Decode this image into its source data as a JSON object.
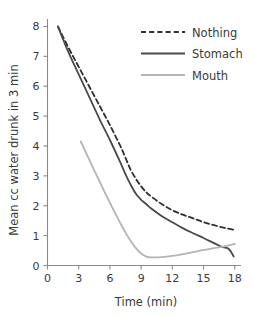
{
  "chart_data": {
    "type": "line",
    "title": "",
    "xlabel": "Time (min)",
    "ylabel": "Mean cc water drunk in 3 min",
    "xlim": [
      0,
      18.6
    ],
    "ylim": [
      0,
      8.25
    ],
    "xticks": [
      0,
      3,
      6,
      9,
      12,
      15,
      18
    ],
    "xtick_labels": [
      "0",
      "3",
      "6",
      "9",
      "12",
      "15",
      "18"
    ],
    "yticks": [
      0,
      1,
      2,
      3,
      4,
      5,
      6,
      7,
      8
    ],
    "ytick_labels": [
      "0",
      "1",
      "2",
      "3",
      "4",
      "5",
      "6",
      "7",
      "8"
    ],
    "grid": false,
    "legend_position": "upper right",
    "series": [
      {
        "name": "Nothing",
        "style": "dashed",
        "color": "#2f2f2f",
        "width": 1.8,
        "x": [
          1.0,
          2.0,
          3.0,
          4.0,
          5.0,
          6.0,
          7.0,
          7.5,
          8.0,
          8.5,
          9.0,
          9.5,
          10.0,
          11.0,
          12.0,
          13.0,
          14.0,
          15.0,
          16.0,
          17.0,
          17.9
        ],
        "y": [
          8.0,
          7.3,
          6.65,
          6.0,
          5.35,
          4.7,
          4.0,
          3.6,
          3.2,
          2.9,
          2.65,
          2.45,
          2.3,
          2.05,
          1.85,
          1.7,
          1.58,
          1.45,
          1.35,
          1.26,
          1.2
        ]
      },
      {
        "name": "Stomach",
        "style": "solid",
        "color": "#4a4a4a",
        "width": 1.8,
        "x": [
          1.0,
          2.0,
          3.0,
          4.0,
          5.0,
          6.0,
          7.0,
          7.5,
          8.0,
          8.5,
          9.0,
          9.5,
          10.0,
          11.0,
          12.0,
          13.0,
          14.0,
          15.0,
          16.0,
          16.8,
          17.3,
          17.6,
          17.9
        ],
        "y": [
          8.0,
          7.15,
          6.4,
          5.65,
          4.9,
          4.2,
          3.45,
          3.05,
          2.7,
          2.4,
          2.2,
          2.05,
          1.9,
          1.65,
          1.45,
          1.25,
          1.08,
          0.92,
          0.75,
          0.62,
          0.58,
          0.48,
          0.3
        ]
      },
      {
        "name": "Mouth",
        "style": "solid",
        "color": "#b4b4b4",
        "width": 1.8,
        "x": [
          3.2,
          3.6,
          4.0,
          4.5,
          5.0,
          5.5,
          6.0,
          6.5,
          7.0,
          7.5,
          8.0,
          8.5,
          9.0,
          9.5,
          10.0,
          11.0,
          12.0,
          13.0,
          14.0,
          15.0,
          16.0,
          17.0,
          18.0
        ],
        "y": [
          4.15,
          3.85,
          3.55,
          3.18,
          2.82,
          2.45,
          2.1,
          1.75,
          1.42,
          1.1,
          0.82,
          0.58,
          0.4,
          0.3,
          0.27,
          0.28,
          0.32,
          0.38,
          0.45,
          0.52,
          0.58,
          0.64,
          0.72
        ]
      }
    ],
    "annotations": []
  },
  "legend": {
    "items": [
      {
        "label": "Nothing"
      },
      {
        "label": "Stomach"
      },
      {
        "label": "Mouth"
      }
    ]
  },
  "axes": {
    "x_title": "Time (min)",
    "y_title": "Mean cc water drunk in 3 min"
  }
}
